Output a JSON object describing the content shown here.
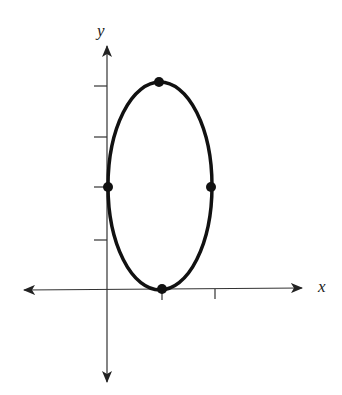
{
  "diagram": {
    "type": "ellipse-graph",
    "axes": {
      "x_label": "x",
      "y_label": "y",
      "x_ticks": [
        1,
        2
      ],
      "y_ticks": [
        1,
        2,
        3,
        4
      ]
    },
    "ellipse": {
      "center": [
        1,
        2
      ],
      "semi_axis_x": 1,
      "semi_axis_y": 2,
      "marked_points": [
        {
          "name": "top-vertex",
          "x": 1,
          "y": 4
        },
        {
          "name": "bottom-vertex",
          "x": 1,
          "y": 0
        },
        {
          "name": "left-covertex",
          "x": 0,
          "y": 2
        },
        {
          "name": "right-covertex",
          "x": 2,
          "y": 2
        }
      ]
    },
    "colors": {
      "stroke": "#111111",
      "axis": "#333333"
    }
  }
}
